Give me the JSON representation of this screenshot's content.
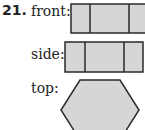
{
  "problem": {
    "number": "21.",
    "views": [
      {
        "label": "front:",
        "shape": "rectangle-3-sections"
      },
      {
        "label": "side:",
        "shape": "rectangle-3-sections"
      },
      {
        "label": "top:",
        "shape": "hexagon"
      }
    ]
  },
  "colors": {
    "fill": "#d6d6d6",
    "stroke": "#2a2a2a"
  }
}
